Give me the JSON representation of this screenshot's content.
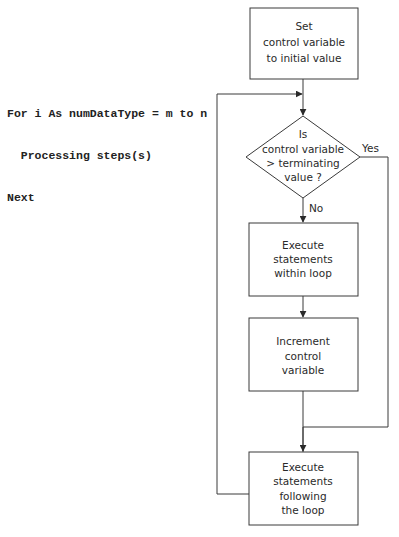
{
  "code": {
    "lines": [
      "For i As numDataType = m to n",
      "  Processing steps(s)",
      "Next"
    ]
  },
  "flowchart": {
    "nodes": {
      "init": {
        "shape": "rectangle",
        "lines": [
          "Set",
          "control variable",
          "to initial value"
        ]
      },
      "condition": {
        "shape": "diamond",
        "lines": [
          "Is",
          "control variable",
          "> terminating",
          "value ?"
        ]
      },
      "body": {
        "shape": "rectangle",
        "lines": [
          "Execute",
          "statements",
          "within loop"
        ]
      },
      "increment": {
        "shape": "rectangle",
        "lines": [
          "Increment",
          "control",
          "variable"
        ]
      },
      "after": {
        "shape": "rectangle",
        "lines": [
          "Execute",
          "statements",
          "following",
          "the loop"
        ]
      }
    },
    "edges": {
      "yes_label": "Yes",
      "no_label": "No"
    },
    "colors": {
      "stroke": "#3a3a3a",
      "text": "#2a2a2a",
      "background": "#ffffff"
    }
  }
}
